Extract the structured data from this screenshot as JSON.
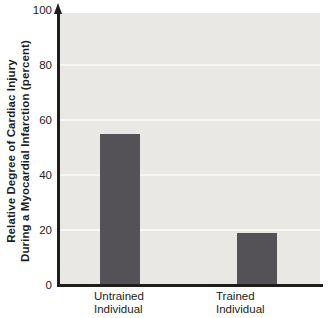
{
  "chart_data": {
    "type": "bar",
    "categories": [
      "Untrained Individual",
      "Trained Individual"
    ],
    "category_lines": [
      [
        "Untrained",
        "Individual"
      ],
      [
        "Trained",
        "Individual"
      ]
    ],
    "values": [
      55,
      19
    ],
    "title": "",
    "xlabel": "",
    "ylabel": "Relative Degree of Cardiac Injury During a Myocardial Infarction (percent)",
    "ylabel_lines": [
      "Relative Degree of Cardiac Injury",
      "During a Myocardial Infarction (percent)"
    ],
    "ylim": [
      0,
      100
    ],
    "yticks": [
      0,
      20,
      40,
      60,
      80,
      100
    ],
    "gridline_values": [
      20,
      40,
      60,
      80
    ],
    "grid": true,
    "legend": "none",
    "bar_color": "#545256",
    "plot_bg": "#e9e8e5",
    "grid_color": "#f7f6f3",
    "axis_color": "#1d1d1b"
  }
}
